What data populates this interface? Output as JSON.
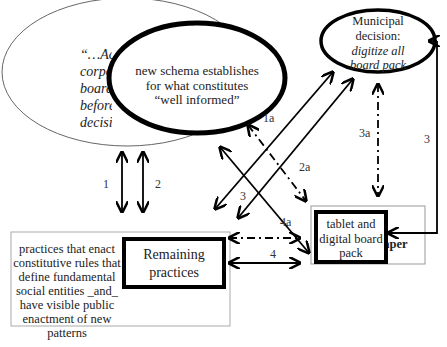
{
  "nodes": {
    "outer_quote": {
      "lines": [
        "“…Acco",
        "corpo",
        "board",
        "before",
        "decision"
      ]
    },
    "new_schema": {
      "lines": [
        "new schema establishes",
        "for what constitutes",
        "“well informed”"
      ]
    },
    "municipal": {
      "lines": [
        "Municipal",
        "decision:",
        "digitize all",
        "board pack"
      ]
    },
    "practices_box": {
      "lines": [
        "practices that enact",
        "constitutive rules that",
        "define fundamental",
        "social entities _and_",
        "have visible public",
        "enactment of new",
        "patterns"
      ]
    },
    "remaining": {
      "lines": [
        "Remaining",
        "practices"
      ]
    },
    "tablet": {
      "lines": [
        "tablet and",
        "digital board",
        "pack"
      ]
    },
    "paper": {
      "label": "paper"
    }
  },
  "edge_labels": {
    "e1": "1",
    "e2": "2",
    "e1a": "1a",
    "e2a": "2a",
    "e3_left": "3",
    "e3a": "3a",
    "e3_right": "3",
    "e4": "4",
    "e4a": "4a"
  }
}
